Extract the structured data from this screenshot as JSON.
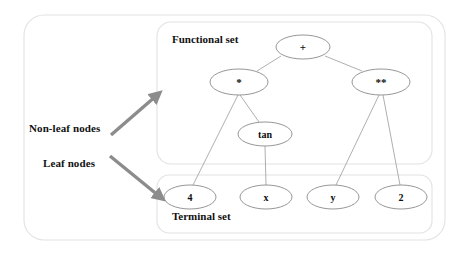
{
  "diagram": {
    "title_functional": "Functional set",
    "title_terminal": "Terminal set",
    "annotations": {
      "non_leaf": "Non-leaf nodes",
      "leaf": "Leaf nodes"
    },
    "colors": {
      "node_stroke": "#8a8a8a",
      "edge_stroke": "#9a9a9a",
      "box_stroke": "#e2e2e2",
      "arrow_fill": "#8c8c8c",
      "text": "#111111",
      "background": "#ffffff"
    },
    "functional_nodes": [
      {
        "id": "plus",
        "label": "+",
        "cx": 303,
        "cy": 47,
        "rx": 27,
        "ry": 12
      },
      {
        "id": "mul",
        "label": "*",
        "cx": 239,
        "cy": 82,
        "rx": 29,
        "ry": 13
      },
      {
        "id": "pow",
        "label": "**",
        "cx": 381,
        "cy": 82,
        "rx": 29,
        "ry": 13
      },
      {
        "id": "tan",
        "label": "tan",
        "cx": 265,
        "cy": 134,
        "rx": 27,
        "ry": 12
      }
    ],
    "terminal_nodes": [
      {
        "id": "four",
        "label": "4",
        "cx": 190,
        "cy": 197,
        "rx": 26,
        "ry": 12
      },
      {
        "id": "xvar",
        "label": "x",
        "cx": 266,
        "cy": 197,
        "rx": 26,
        "ry": 12
      },
      {
        "id": "yvar",
        "label": "y",
        "cx": 333,
        "cy": 197,
        "rx": 26,
        "ry": 12
      },
      {
        "id": "two",
        "label": "2",
        "cx": 401,
        "cy": 197,
        "rx": 26,
        "ry": 12
      }
    ],
    "edges": [
      {
        "from": "plus",
        "to": "mul",
        "x1": 281,
        "y1": 56,
        "x2": 257,
        "y2": 71
      },
      {
        "from": "plus",
        "to": "pow",
        "x1": 325,
        "y1": 56,
        "x2": 362,
        "y2": 71
      },
      {
        "from": "mul",
        "to": "four",
        "x1": 238,
        "y1": 95,
        "x2": 193,
        "y2": 185
      },
      {
        "from": "mul",
        "to": "tan",
        "x1": 240,
        "y1": 95,
        "x2": 259,
        "y2": 122
      },
      {
        "from": "tan",
        "to": "xvar",
        "x1": 265,
        "y1": 146,
        "x2": 266,
        "y2": 185
      },
      {
        "from": "pow",
        "to": "yvar",
        "x1": 379,
        "y1": 95,
        "x2": 336,
        "y2": 185
      },
      {
        "from": "pow",
        "to": "two",
        "x1": 383,
        "y1": 95,
        "x2": 400,
        "y2": 185
      }
    ],
    "arrows": [
      {
        "id": "arrow-non-leaf",
        "x1": 111,
        "y1": 135,
        "x2": 156,
        "y2": 96
      },
      {
        "id": "arrow-leaf",
        "x1": 110,
        "y1": 156,
        "x2": 159,
        "y2": 196
      }
    ],
    "boxes": {
      "outer": {
        "x": 24,
        "y": 15,
        "w": 421,
        "h": 225,
        "r": 20
      },
      "functional": {
        "x": 157,
        "y": 22,
        "w": 275,
        "h": 142,
        "r": 14
      },
      "terminal": {
        "x": 157,
        "y": 175,
        "w": 275,
        "h": 58,
        "r": 12
      }
    },
    "label_positions": {
      "non_leaf": {
        "x": 29,
        "y": 122
      },
      "leaf": {
        "x": 43,
        "y": 157
      },
      "functional": {
        "x": 172,
        "y": 33
      },
      "terminal": {
        "x": 172,
        "y": 210
      }
    }
  }
}
